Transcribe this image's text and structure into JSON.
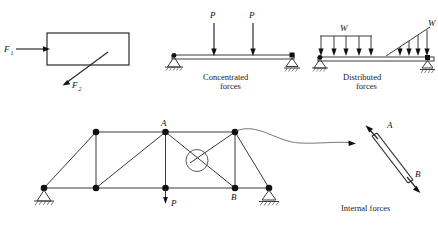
{
  "figure": {
    "panels": [
      {
        "id": "external-forces",
        "caption": "",
        "labels": {
          "force1": "F",
          "force1_sub": "1",
          "force2": "F",
          "force2_sub": "2"
        },
        "body_shape": "rectangle"
      },
      {
        "id": "concentrated-forces",
        "caption_line1": "Concentrated",
        "caption_line2": "forces",
        "load_label": "P",
        "load_count": 2,
        "supports": [
          "pin",
          "roller"
        ]
      },
      {
        "id": "distributed-forces",
        "caption_line1": "Distributed",
        "caption_line2": "forces",
        "load_label_uniform": "W",
        "load_label_triangular": "W",
        "uniform_arrow_count": 5,
        "triangular_arrow_count": 4,
        "supports": [
          "pin",
          "roller"
        ]
      },
      {
        "id": "truss",
        "caption": "",
        "node_top_label": "A",
        "node_bottom_label": "B",
        "point_load_label": "P",
        "supports": [
          "pin",
          "roller"
        ],
        "highlight": "circled-diagonal-member"
      },
      {
        "id": "internal-forces",
        "caption": "Internal forces",
        "end_label_top": "A",
        "end_label_bottom": "B",
        "member_state": "tension"
      }
    ],
    "colors": {
      "ink": "#1a1a1a",
      "line": "#3a3a3a",
      "node": "#111111"
    }
  }
}
